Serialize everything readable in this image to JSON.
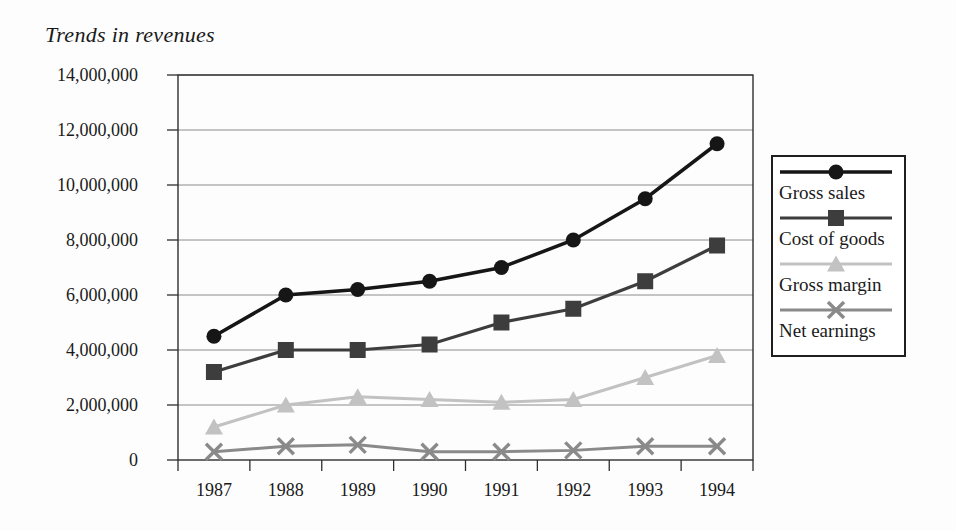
{
  "chart_data": {
    "type": "line",
    "title": "Trends in revenues",
    "x_labels": [
      "1987",
      "1988",
      "1989",
      "1990",
      "1991",
      "1992",
      "1993",
      "1994"
    ],
    "series": [
      {
        "name": "Gross sales",
        "marker": "circle",
        "color": "#161616",
        "line_width": 3.5,
        "values": [
          4500000,
          6000000,
          6200000,
          6500000,
          7000000,
          8000000,
          9500000,
          11500000
        ]
      },
      {
        "name": "Cost of goods",
        "marker": "square",
        "color": "#3d3d3d",
        "line_width": 3.2,
        "values": [
          3200000,
          4000000,
          4000000,
          4200000,
          5000000,
          5500000,
          6500000,
          7800000
        ]
      },
      {
        "name": "Gross margin",
        "marker": "triangle",
        "color": "#c2c2c2",
        "line_width": 3,
        "values": [
          1200000,
          2000000,
          2300000,
          2200000,
          2100000,
          2200000,
          3000000,
          3800000
        ]
      },
      {
        "name": "Net earnings",
        "marker": "x",
        "color": "#8a8a8a",
        "line_width": 3,
        "values": [
          300000,
          500000,
          550000,
          300000,
          300000,
          350000,
          500000,
          500000
        ]
      }
    ],
    "ylim": [
      0,
      14000000
    ],
    "y_tick_step": 2000000,
    "y_ticks": [
      {
        "v": 0,
        "label": "0"
      },
      {
        "v": 2000000,
        "label": "2,000,000"
      },
      {
        "v": 4000000,
        "label": "4,000,000"
      },
      {
        "v": 6000000,
        "label": "6,000,000"
      },
      {
        "v": 8000000,
        "label": "8,000,000"
      },
      {
        "v": 10000000,
        "label": "10,000,000"
      },
      {
        "v": 12000000,
        "label": "12,000,000"
      },
      {
        "v": 14000000,
        "label": "14,000,000"
      }
    ],
    "grid": "horizontal",
    "legend_position": "right"
  },
  "colors": {
    "grid": "#8c8c8c",
    "frame": "#2e2e2e",
    "text": "#1a1a1a",
    "background": "#fdfdfd"
  }
}
